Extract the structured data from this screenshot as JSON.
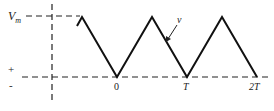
{
  "diagram": {
    "labels": {
      "vm_main": "V",
      "vm_sub": "m",
      "signal": "v",
      "plus": "+",
      "minus": "-",
      "tick_0": "0",
      "tick_T": "T",
      "tick_2T": "2T"
    },
    "waveform": {
      "type": "triangle",
      "peak_label": "Vm",
      "min_value": 0,
      "valleys_at": [
        "0",
        "T",
        "2T"
      ],
      "peaks_between_valleys": true
    },
    "colors": {
      "line": "#111111",
      "text": "#222222",
      "background": "#ffffff"
    }
  }
}
